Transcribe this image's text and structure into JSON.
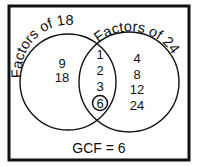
{
  "diagram": {
    "type": "venn",
    "sets": [
      {
        "label": "Factors of 18",
        "only": [
          "9",
          "18"
        ]
      },
      {
        "label": "Factors of 24",
        "only": [
          "4",
          "8",
          "12",
          "24"
        ]
      }
    ],
    "intersection": [
      "1",
      "2",
      "3",
      "6"
    ],
    "highlighted": "6",
    "footer": "GCF = 6"
  }
}
